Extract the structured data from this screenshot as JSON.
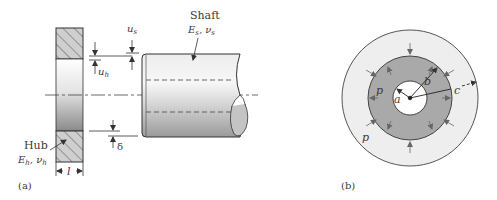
{
  "figure": {
    "panel_a": {
      "caption": "(a)",
      "shaft": {
        "title": "Shaft",
        "props": "Es, νs",
        "E": "E",
        "E_sub": "s",
        "nu": "ν",
        "nu_sub": "s"
      },
      "hub": {
        "title": "Hub",
        "props": "Eh, νh",
        "E": "E",
        "E_sub": "h",
        "nu": "ν",
        "nu_sub": "h"
      },
      "dimensions": {
        "u_s": {
          "sym": "u",
          "sub": "s"
        },
        "u_h": {
          "sym": "u",
          "sub": "h"
        },
        "delta": "δ",
        "length": "l"
      }
    },
    "panel_b": {
      "caption": "(b)",
      "radii": {
        "inner": "a",
        "interface": "b",
        "outer": "c"
      },
      "pressure_inner_label": "p",
      "pressure_outer_label": "p"
    },
    "colors": {
      "line": "#333333",
      "hatch_fill": "#c8c8c8",
      "ring_dark": "#a8a8a8",
      "ring_light": "#ececec",
      "arrow": "#555555"
    }
  }
}
